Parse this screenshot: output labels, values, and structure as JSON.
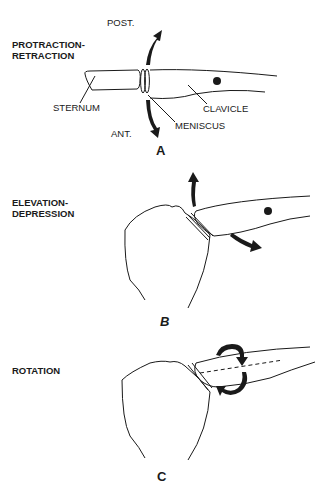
{
  "panels": [
    {
      "letter": "A",
      "title_line1": "PROTRACTION-",
      "title_line2": "RETRACTION",
      "labels": {
        "post": "POST.",
        "ant": "ANT.",
        "sternum": "STERNUM",
        "clavicle": "CLAVICLE",
        "meniscus": "MENISCUS"
      }
    },
    {
      "letter": "B",
      "title_line1": "ELEVATION-",
      "title_line2": "DEPRESSION"
    },
    {
      "letter": "C",
      "title_line1": "ROTATION"
    }
  ],
  "colors": {
    "line": "#1a1a1a",
    "background": "#ffffff"
  }
}
